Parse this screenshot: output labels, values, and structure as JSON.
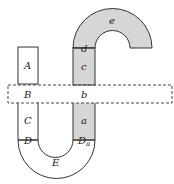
{
  "diagram": {
    "width": 174,
    "height": 184,
    "colors": {
      "stroke": "#333333",
      "shaded_fill": "#d6d6d6",
      "unshaded_fill": "#ffffff",
      "dashed_stroke": "#444444"
    },
    "labels": {
      "A": "A",
      "B": "B",
      "C": "C",
      "D": "D",
      "E": "E",
      "a": "a",
      "b": "b",
      "c": "c",
      "d": "d",
      "e": "e",
      "Da_main": "D",
      "Da_sub": "a"
    },
    "regions": [
      {
        "id": "A",
        "shaded": false,
        "description": "rectangle above dashed band, left column"
      },
      {
        "id": "B",
        "shaded": false,
        "description": "left part of dashed band"
      },
      {
        "id": "C",
        "shaded": false,
        "description": "left column below band"
      },
      {
        "id": "D",
        "shaded": false,
        "description": "boundary line at top of left arc"
      },
      {
        "id": "E",
        "shaded": false,
        "description": "bottom U-shaped arc"
      },
      {
        "id": "a",
        "shaded": true,
        "description": "right column below band"
      },
      {
        "id": "b",
        "shaded": false,
        "description": "right part of dashed band"
      },
      {
        "id": "c",
        "shaded": true,
        "description": "right column above band"
      },
      {
        "id": "d",
        "shaded": true,
        "description": "boundary line at base of top arch"
      },
      {
        "id": "e",
        "shaded": true,
        "description": "top inverted-U arch"
      },
      {
        "id": "Da",
        "shaded": false,
        "description": "boundary line at top of right side of bottom arc"
      }
    ]
  }
}
